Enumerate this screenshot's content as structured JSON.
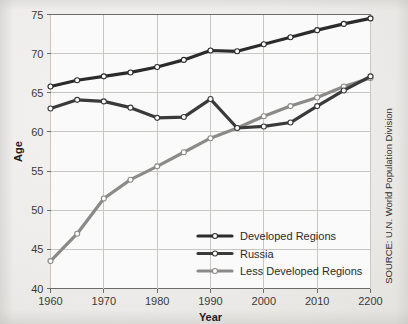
{
  "chart_data": {
    "type": "line",
    "title": "",
    "xlabel": "Year",
    "ylabel": "Age",
    "xlim": [
      1960,
      2020
    ],
    "ylim": [
      40,
      75
    ],
    "xticks": [
      "1960",
      "1970",
      "1980",
      "1990",
      "2000",
      "2010",
      "2200"
    ],
    "xtick_values": [
      1960,
      1970,
      1980,
      1990,
      2000,
      2010,
      2020
    ],
    "yticks": [
      "40",
      "45",
      "50",
      "55",
      "60",
      "65",
      "70",
      "75"
    ],
    "ytick_values": [
      40,
      45,
      50,
      55,
      60,
      65,
      70,
      75
    ],
    "grid": true,
    "legend_position": "lower-right-inside",
    "x": [
      1960,
      1965,
      1970,
      1975,
      1980,
      1985,
      1990,
      1995,
      2000,
      2005,
      2010,
      2015,
      2020
    ],
    "series": [
      {
        "name": "Developed Regions",
        "color": "#2b2b2b",
        "values": [
          65.8,
          66.6,
          67.1,
          67.6,
          68.3,
          69.2,
          70.4,
          70.3,
          71.2,
          72.1,
          73.0,
          73.8,
          74.5
        ]
      },
      {
        "name": "Russia",
        "color": "#3a3a3a",
        "values": [
          63.0,
          64.1,
          63.9,
          63.1,
          61.8,
          61.9,
          64.2,
          60.5,
          60.7,
          61.2,
          63.3,
          65.3,
          67.1
        ]
      },
      {
        "name": "Less Developed Regions",
        "color": "#8c8a88",
        "values": [
          43.5,
          47.0,
          51.5,
          53.9,
          55.6,
          57.4,
          59.2,
          60.5,
          62.0,
          63.3,
          64.4,
          65.8,
          66.9
        ]
      }
    ],
    "source": "SOURCE: U.N. World Population Division"
  },
  "legend": {
    "items": [
      {
        "label": "Developed Regions"
      },
      {
        "label": "Russia"
      },
      {
        "label": "Less Developed Regions"
      }
    ]
  },
  "axes": {
    "x_title": "Year",
    "y_title": "Age"
  },
  "source_text": "SOURCE: U.N. World Population Division"
}
